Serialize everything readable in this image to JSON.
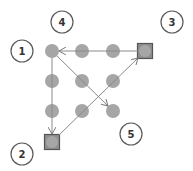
{
  "diagram": {
    "width": 193,
    "height": 171,
    "colors": {
      "dot": "#a6a6a6",
      "square_fill": "#a6a6a6",
      "square_border": "#555555",
      "line": "#8a8a8a",
      "label_circle": "#5a5a5a",
      "label_text": "#333333"
    },
    "grid_dots": [
      {
        "id": "r1c1",
        "x": 52,
        "y": 51
      },
      {
        "id": "r1c2",
        "x": 82,
        "y": 51
      },
      {
        "id": "r1c3",
        "x": 113,
        "y": 51
      },
      {
        "id": "r2c1",
        "x": 52,
        "y": 81
      },
      {
        "id": "r2c2",
        "x": 82,
        "y": 81
      },
      {
        "id": "r2c3",
        "x": 113,
        "y": 81
      },
      {
        "id": "r3c1",
        "x": 52,
        "y": 111
      },
      {
        "id": "r3c2",
        "x": 82,
        "y": 111
      },
      {
        "id": "r3c3",
        "x": 113,
        "y": 111
      }
    ],
    "square_nodes": [
      {
        "id": "top-right",
        "x": 145,
        "y": 51,
        "size": 15
      },
      {
        "id": "bottom-left",
        "x": 52,
        "y": 142,
        "size": 15
      }
    ],
    "arrows": [
      {
        "from": [
          138,
          51
        ],
        "to": [
          59,
          51
        ]
      },
      {
        "from": [
          52,
          58
        ],
        "to": [
          52,
          134
        ]
      },
      {
        "from": [
          59,
          135
        ],
        "to": [
          138,
          58
        ]
      },
      {
        "from": [
          57,
          56
        ],
        "to": [
          108,
          106
        ]
      }
    ],
    "labels": [
      {
        "text": "1",
        "x": 22,
        "y": 51
      },
      {
        "text": "4",
        "x": 62,
        "y": 22
      },
      {
        "text": "3",
        "x": 172,
        "y": 22
      },
      {
        "text": "5",
        "x": 131,
        "y": 134
      },
      {
        "text": "2",
        "x": 22,
        "y": 154
      }
    ]
  }
}
